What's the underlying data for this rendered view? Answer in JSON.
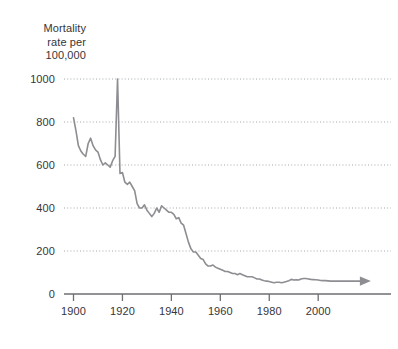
{
  "chart_data": {
    "type": "line",
    "title": "Mortality\nrate per\n100,000",
    "title_lines": [
      "Mortality",
      "rate per",
      "100,000"
    ],
    "xlabel": "",
    "ylabel": "Mortality rate per 100,000",
    "xlim": [
      1895,
      2010
    ],
    "ylim": [
      0,
      1060
    ],
    "yticks": [
      0,
      200,
      400,
      600,
      800,
      1000
    ],
    "ytick_labels": [
      "0",
      "200",
      "400",
      "600",
      "800",
      "1000"
    ],
    "xticks": [
      1900,
      1920,
      1940,
      1960,
      1980,
      2000
    ],
    "xtick_labels": [
      "1900",
      "1920",
      "1940",
      "1960",
      "1980",
      "2000"
    ],
    "grid": "horizontal-dotted",
    "legend": "none",
    "line_color": "#8d8d92",
    "grid_color": "#9aa0a6",
    "axis_color": "#6e6e73",
    "text_color": "#35353a",
    "background_color": "#ffffff",
    "end_marker": "arrowhead-right",
    "series": [
      {
        "name": "Mortality rate per 100,000",
        "x": [
          1900,
          1901,
          1902,
          1903,
          1904,
          1905,
          1906,
          1907,
          1908,
          1909,
          1910,
          1911,
          1912,
          1913,
          1914,
          1915,
          1916,
          1917,
          1918,
          1919,
          1920,
          1921,
          1922,
          1923,
          1924,
          1925,
          1926,
          1927,
          1928,
          1929,
          1930,
          1931,
          1932,
          1933,
          1934,
          1935,
          1936,
          1937,
          1938,
          1939,
          1940,
          1941,
          1942,
          1943,
          1944,
          1945,
          1946,
          1947,
          1948,
          1949,
          1950,
          1951,
          1952,
          1953,
          1954,
          1955,
          1956,
          1957,
          1958,
          1959,
          1960,
          1961,
          1962,
          1963,
          1964,
          1965,
          1966,
          1967,
          1968,
          1969,
          1970,
          1971,
          1972,
          1973,
          1974,
          1975,
          1976,
          1977,
          1978,
          1979,
          1980,
          1981,
          1982,
          1983,
          1984,
          1985,
          1986,
          1987,
          1988,
          1989,
          1990,
          1991,
          1992,
          1993,
          1994,
          1995,
          1996,
          1997,
          1998,
          1999,
          2000,
          2001,
          2002,
          2003,
          2004,
          2005,
          2006
        ],
        "values": [
          820,
          760,
          690,
          665,
          650,
          640,
          700,
          725,
          690,
          670,
          660,
          625,
          600,
          610,
          600,
          590,
          620,
          640,
          1000,
          560,
          565,
          520,
          510,
          520,
          500,
          480,
          420,
          400,
          400,
          415,
          390,
          375,
          360,
          375,
          400,
          380,
          410,
          400,
          390,
          380,
          380,
          370,
          350,
          355,
          330,
          320,
          280,
          240,
          210,
          195,
          195,
          180,
          165,
          160,
          140,
          130,
          130,
          135,
          125,
          120,
          115,
          110,
          105,
          105,
          100,
          95,
          95,
          90,
          95,
          90,
          85,
          80,
          80,
          80,
          75,
          70,
          70,
          65,
          62,
          60,
          58,
          55,
          52,
          55,
          55,
          52,
          55,
          58,
          62,
          68,
          65,
          66,
          65,
          70,
          72,
          72,
          70,
          68,
          67,
          66,
          65,
          63,
          62,
          62,
          61,
          60,
          60
        ]
      }
    ]
  }
}
